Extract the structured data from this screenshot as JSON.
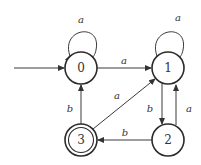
{
  "diagram": {
    "type": "finite-automaton",
    "start_state": "0",
    "accept_states": [
      "3"
    ],
    "states": [
      {
        "id": "0",
        "label": "0",
        "cx": 81,
        "cy": 68,
        "accepting": false
      },
      {
        "id": "1",
        "label": "1",
        "cx": 168,
        "cy": 68,
        "accepting": false
      },
      {
        "id": "2",
        "label": "2",
        "cx": 168,
        "cy": 140,
        "accepting": false
      },
      {
        "id": "3",
        "label": "3",
        "cx": 81,
        "cy": 140,
        "accepting": true
      }
    ],
    "transitions": [
      {
        "from": "0",
        "to": "0",
        "label": "a"
      },
      {
        "from": "0",
        "to": "1",
        "label": "a"
      },
      {
        "from": "1",
        "to": "1",
        "label": "a"
      },
      {
        "from": "1",
        "to": "2",
        "label": "b"
      },
      {
        "from": "2",
        "to": "1",
        "label": "a"
      },
      {
        "from": "2",
        "to": "3",
        "label": "b"
      },
      {
        "from": "3",
        "to": "0",
        "label": "b"
      },
      {
        "from": "3",
        "to": "1",
        "label": "a"
      }
    ],
    "labels": {
      "s0": "0",
      "s1": "1",
      "s2": "2",
      "s3": "3",
      "t00": "a",
      "t01": "a",
      "t11": "a",
      "t12": "b",
      "t21": "a",
      "t23": "b",
      "t30": "b",
      "t31": "a"
    }
  }
}
